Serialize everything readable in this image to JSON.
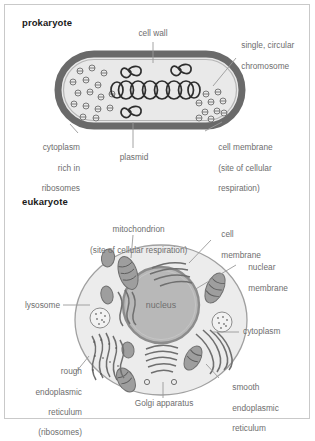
{
  "figure": {
    "kind": "biology-diagram",
    "topic": "Comparison of prokaryotic and eukaryotic cell structure",
    "colors": {
      "frame_border": "#c9c9c9",
      "label_text": "#6e6e6e",
      "title_text": "#1a1a1a",
      "leader_line": "#9a9a9a",
      "cell_wall": "#6a6a6a",
      "cytoplasm_fill": "#e9e9e9",
      "nucleus_fill": "#b8b8b8",
      "nucleus_border": "#8c8c8c",
      "organelle_fill": "#a8a8a8",
      "organelle_stroke": "#6f6f6f",
      "membrane_stroke": "#a0a0a0"
    }
  },
  "sections": {
    "prokaryote": {
      "title": "prokaryote",
      "labels": {
        "cell_wall": "cell wall",
        "chromosome_line1": "single, circular",
        "chromosome_line2": "chromosome",
        "cytoplasm_line1": "cytoplasm",
        "cytoplasm_line2": "rich in",
        "cytoplasm_line3": "ribosomes",
        "plasmid": "plasmid",
        "membrane_line1": "cell membrane",
        "membrane_line2": "(site of cellular",
        "membrane_line3": "respiration)"
      },
      "structures": [
        "cell wall",
        "cell membrane",
        "cytoplasm rich in ribosomes",
        "single, circular chromosome",
        "plasmid"
      ],
      "counts": {
        "plasmids": 3,
        "chromosome_coils": 9
      }
    },
    "eukaryote": {
      "title": "eukaryote",
      "labels": {
        "mitochondrion_line1": "mitochondrion",
        "mitochondrion_line2": "(site of cellular respiration)",
        "cell_membrane_line1": "cell",
        "cell_membrane_line2": "membrane",
        "nuclear_membrane_line1": "nuclear",
        "nuclear_membrane_line2": "membrane",
        "lysosome": "lysosome",
        "nucleus": "nucleus",
        "cytoplasm": "cytoplasm",
        "rough_er_line1": "rough",
        "rough_er_line2": "endoplasmic",
        "rough_er_line3": "reticulum",
        "rough_er_line4": "(ribosomes)",
        "golgi": "Golgi apparatus",
        "smooth_er_line1": "smooth",
        "smooth_er_line2": "endoplasmic",
        "smooth_er_line3": "reticulum"
      },
      "structures": [
        "cell membrane",
        "nuclear membrane",
        "nucleus",
        "mitochondrion",
        "lysosome",
        "cytoplasm",
        "rough endoplasmic reticulum (ribosomes)",
        "smooth endoplasmic reticulum",
        "Golgi apparatus"
      ],
      "counts": {
        "mitochondria": 7,
        "lysosomes": 2
      }
    }
  }
}
